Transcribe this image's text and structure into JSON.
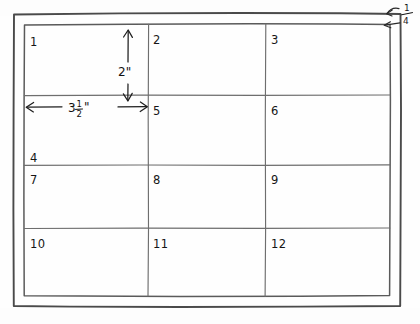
{
  "document": {
    "type": "hand-drawn-sketch",
    "title": "Hand-drawn grid layout sketch",
    "medium": "pencil on paper",
    "background_color": "#fefefe",
    "ink_color": "#1e1e1e"
  },
  "drawing": {
    "outer_frame": {
      "name": "outer-border",
      "x": 13,
      "y": 13,
      "width": 388,
      "height": 294
    },
    "inner_frame": {
      "name": "inner-border",
      "x": 24,
      "y": 24,
      "width": 366,
      "height": 272
    },
    "grid": {
      "columns": 3,
      "rows": 4,
      "vertical_lines_x": [
        148,
        265
      ],
      "horizontal_lines_y": [
        95,
        165,
        228
      ]
    },
    "cells": [
      {
        "label": "1",
        "col": 1,
        "row": 1,
        "x": 30,
        "y": 46
      },
      {
        "label": "2",
        "col": 2,
        "row": 1,
        "x": 153,
        "y": 44
      },
      {
        "label": "3",
        "col": 3,
        "row": 1,
        "x": 271,
        "y": 44
      },
      {
        "label": "5",
        "col": 2,
        "row": 2,
        "x": 153,
        "y": 115
      },
      {
        "label": "6",
        "col": 3,
        "row": 2,
        "x": 271,
        "y": 115
      },
      {
        "label": "7",
        "col": 1,
        "row": 3,
        "x": 30,
        "y": 184
      },
      {
        "label": "8",
        "col": 2,
        "row": 3,
        "x": 153,
        "y": 184
      },
      {
        "label": "9",
        "col": 3,
        "row": 3,
        "x": 271,
        "y": 184
      },
      {
        "label": "10",
        "col": 1,
        "row": 4,
        "x": 30,
        "y": 248
      },
      {
        "label": "11",
        "col": 2,
        "row": 4,
        "x": 153,
        "y": 248
      },
      {
        "label": "12",
        "col": 3,
        "row": 4,
        "x": 271,
        "y": 248
      }
    ],
    "stray_label": {
      "name": "label-4",
      "label": "4",
      "x": 30,
      "y": 162
    }
  },
  "annotations": {
    "vertical_dimension": {
      "name": "vertical-dimension-2-inches",
      "value": "2",
      "unit": "\"",
      "display": "2\"",
      "label_x": 118,
      "label_y": 74,
      "arrow_x": 128,
      "arrow_top_y": 30,
      "arrow_bottom_y": 100
    },
    "horizontal_dimension": {
      "name": "horizontal-dimension-3-and-a-half-inches",
      "whole": "3",
      "numerator": "1",
      "denominator": "2",
      "unit": "\"",
      "display": "3½\"",
      "label_x": 76,
      "label_y": 112,
      "arrow_y": 107,
      "arrow_left_x": 26,
      "arrow_right_x": 147
    },
    "corner_margin": {
      "name": "corner-margin-quarter-inch",
      "numerator": "1",
      "denominator": "4",
      "display": "¼",
      "label_x": 406,
      "label_y": 12,
      "arrows": [
        {
          "from_x": 400,
          "from_y": 10,
          "to_x": 388,
          "to_y": 14
        },
        {
          "from_x": 400,
          "from_y": 22,
          "to_x": 384,
          "to_y": 25
        }
      ]
    }
  }
}
